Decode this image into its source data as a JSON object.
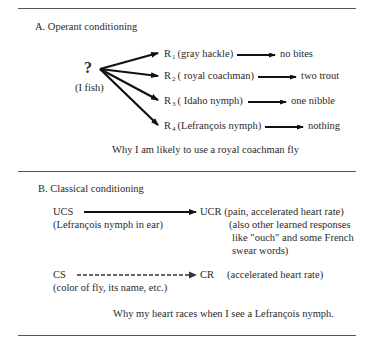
{
  "section_a": {
    "heading": "A.  Operant conditioning",
    "stimulus": "?",
    "stimulus_label": "(I fish)",
    "responses": [
      {
        "r": "R",
        "sub": "1",
        "fly": "(gray hackle)",
        "outcome": "no bites"
      },
      {
        "r": "R",
        "sub": "2",
        "fly": "( royal coachman)",
        "outcome": "two trout"
      },
      {
        "r": "R",
        "sub": "3",
        "fly": "( Idaho nymph)",
        "outcome": "one nibble"
      },
      {
        "r": "R",
        "sub": "4",
        "fly": "(Lefrançois nymph)",
        "outcome": "nothing"
      }
    ],
    "caption": "Why I am likely to use a royal coachman fly"
  },
  "section_b": {
    "heading": "B.  Classical conditioning",
    "ucs": "UCS",
    "ucs_desc": "(Lefrançois nymph in ear)",
    "ucr": "UCR",
    "ucr_desc_lines": [
      "(pain, accelerated heart rate)",
      "(also other learned responses",
      "like \"ouch\" and some French",
      "swear words)"
    ],
    "cs": "CS",
    "cs_desc": "(color of fly, its name, etc.)",
    "cr": "CR",
    "cr_desc": "(accelerated heart rate)",
    "caption": "Why my heart races when I see a Lefrançois nymph."
  }
}
